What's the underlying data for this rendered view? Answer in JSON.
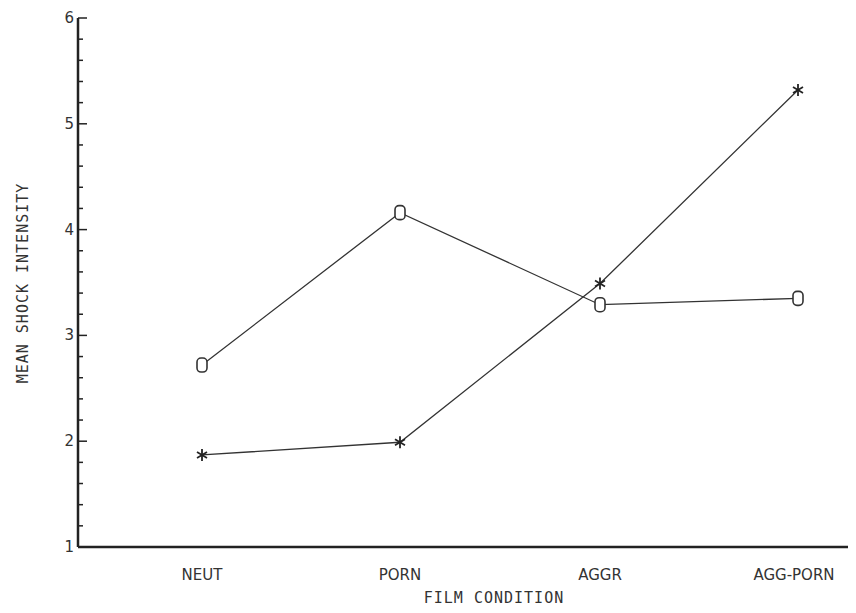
{
  "chart_data": {
    "type": "line",
    "title": "",
    "xlabel": "FILM CONDITION",
    "ylabel": "MEAN SHOCK INTENSITY",
    "categories": [
      "NEUT",
      "PORN",
      "AGGR",
      "AGG-PORN"
    ],
    "ylim": [
      1,
      6
    ],
    "yticks": [
      1,
      2,
      3,
      4,
      5,
      6
    ],
    "yminor_step": 0.2,
    "grid": false,
    "legend": null,
    "series": [
      {
        "name": "O",
        "marker": "O",
        "values": [
          2.72,
          4.16,
          3.29,
          3.35
        ]
      },
      {
        "name": "*",
        "marker": "*",
        "values": [
          1.87,
          1.99,
          3.49,
          5.32
        ]
      }
    ]
  }
}
